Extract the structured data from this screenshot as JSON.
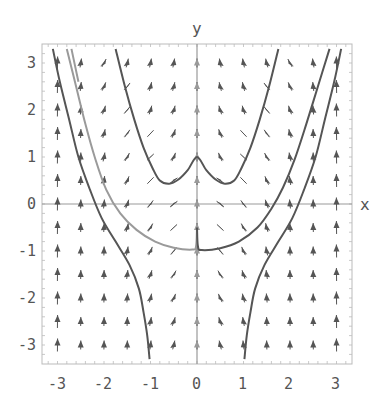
{
  "chart_data": {
    "type": "line",
    "subtype": "direction-field-with-solution-curves",
    "title": "",
    "xlabel": "x",
    "ylabel": "y",
    "xlim": [
      -3.3,
      3.3
    ],
    "ylim": [
      -3.3,
      3.3
    ],
    "grid": false,
    "legend": null,
    "x_ticks": [
      -3,
      -2,
      -1,
      0,
      1,
      2,
      3
    ],
    "y_ticks": [
      -3,
      -2,
      -1,
      0,
      1,
      2,
      3
    ],
    "x_tick_labels": [
      "-3",
      "-2",
      "-1",
      "0",
      "1",
      "2",
      "3"
    ],
    "y_tick_labels": [
      "-3",
      "-2",
      "-1",
      "0",
      "1",
      "2",
      "3"
    ],
    "direction_field": {
      "x_samples": [
        -3,
        -2.5,
        -2,
        -1.5,
        -1,
        -0.5,
        0,
        0.5,
        1,
        1.5,
        2,
        2.5,
        3
      ],
      "y_samples": [
        -3,
        -2.5,
        -2,
        -1.5,
        -1,
        -0.5,
        0,
        0.5,
        1,
        1.5,
        2,
        2.5,
        3
      ],
      "arrow_color": "#555555"
    },
    "series": [
      {
        "name": "upper-w-curve",
        "color": "#555555",
        "points": [
          [
            -1.75,
            3.3
          ],
          [
            -1.55,
            2.5
          ],
          [
            -1.35,
            1.8
          ],
          [
            -1.15,
            1.2
          ],
          [
            -0.95,
            0.75
          ],
          [
            -0.8,
            0.5
          ],
          [
            -0.6,
            0.43
          ],
          [
            -0.4,
            0.52
          ],
          [
            -0.2,
            0.72
          ],
          [
            0,
            1
          ],
          [
            0.2,
            0.72
          ],
          [
            0.4,
            0.52
          ],
          [
            0.6,
            0.43
          ],
          [
            0.8,
            0.5
          ],
          [
            0.95,
            0.75
          ],
          [
            1.15,
            1.2
          ],
          [
            1.35,
            1.8
          ],
          [
            1.55,
            2.5
          ],
          [
            1.75,
            3.3
          ]
        ]
      },
      {
        "name": "lower-u-curve-left",
        "color": "#9a9a9a",
        "points": [
          [
            -2.8,
            3.3
          ],
          [
            -2.6,
            2.5
          ],
          [
            -2.4,
            1.7
          ],
          [
            -2.2,
            1.0
          ],
          [
            -1.95,
            0.3
          ],
          [
            -1.65,
            -0.2
          ],
          [
            -1.3,
            -0.55
          ],
          [
            -0.9,
            -0.8
          ],
          [
            -0.5,
            -0.93
          ],
          [
            -0.1,
            -0.97
          ],
          [
            -0.02,
            -0.9
          ],
          [
            0,
            -0.5
          ]
        ]
      },
      {
        "name": "lower-u-curve-right",
        "color": "#555555",
        "points": [
          [
            0,
            -0.5
          ],
          [
            0.02,
            -0.9
          ],
          [
            0.1,
            -0.98
          ],
          [
            0.5,
            -0.94
          ],
          [
            0.9,
            -0.8
          ],
          [
            1.3,
            -0.5
          ],
          [
            1.6,
            -0.1
          ],
          [
            1.85,
            0.35
          ],
          [
            2.1,
            0.95
          ],
          [
            2.35,
            1.7
          ],
          [
            2.6,
            2.5
          ],
          [
            2.85,
            3.3
          ]
        ]
      },
      {
        "name": "outer-left-curve",
        "color": "#555555",
        "points": [
          [
            -3.1,
            3.3
          ],
          [
            -2.95,
            2.6
          ],
          [
            -2.75,
            1.8
          ],
          [
            -2.55,
            1.0
          ],
          [
            -2.3,
            0.3
          ],
          [
            -2.05,
            -0.3
          ],
          [
            -1.75,
            -0.8
          ],
          [
            -1.45,
            -1.3
          ],
          [
            -1.25,
            -1.8
          ],
          [
            -1.15,
            -2.3
          ],
          [
            -1.07,
            -2.8
          ],
          [
            -1.02,
            -3.3
          ]
        ]
      },
      {
        "name": "outer-right-curve",
        "color": "#555555",
        "points": [
          [
            1.02,
            -3.3
          ],
          [
            1.07,
            -2.8
          ],
          [
            1.15,
            -2.3
          ],
          [
            1.25,
            -1.8
          ],
          [
            1.45,
            -1.3
          ],
          [
            1.75,
            -0.8
          ],
          [
            2.05,
            -0.3
          ],
          [
            2.3,
            0.3
          ],
          [
            2.55,
            1.0
          ],
          [
            2.75,
            1.8
          ],
          [
            2.95,
            2.6
          ],
          [
            3.1,
            3.3
          ]
        ]
      },
      {
        "name": "upper-left-gray-curve",
        "color": "#9a9a9a",
        "points": [
          [
            -2.7,
            3.3
          ],
          [
            -2.55,
            2.6
          ]
        ]
      }
    ]
  },
  "axes": {
    "x_title": "x",
    "y_title": "y",
    "x_ticks": [
      "-3",
      "-2",
      "-1",
      "0",
      "1",
      "2",
      "3"
    ],
    "y_ticks": [
      "3",
      "2",
      "1",
      "0",
      "-1",
      "-2",
      "-3"
    ]
  }
}
